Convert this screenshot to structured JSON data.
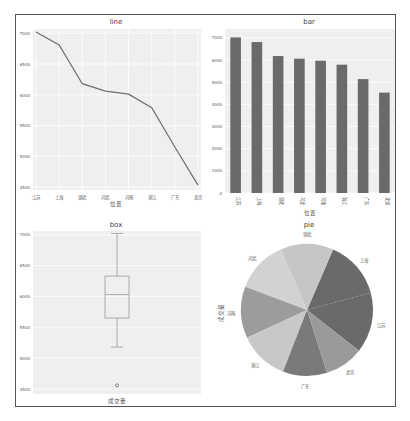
{
  "figure": {
    "panels": [
      "line",
      "bar",
      "box",
      "pie"
    ]
  },
  "colors": {
    "plot_bg": "#efefef",
    "grid": "#ffffff",
    "line": "#6e6e6e",
    "bar": "#6a6a6a",
    "box": "#9a9a9a",
    "text": "#555555",
    "frame": "#555555",
    "pie": [
      "#6a6a6a",
      "#6a6a6a",
      "#c6c6c6",
      "#d2d2d2",
      "#9c9c9c",
      "#c8c8c8",
      "#7a7a7a",
      "#9a9a9a"
    ]
  },
  "chart_data": [
    {
      "type": "line",
      "title": "line",
      "xlabel": "位置",
      "ylabel": "",
      "categories": [
        "江苏",
        "上海",
        "湖北",
        "河北",
        "河南",
        "浙江",
        "广东",
        "北京"
      ],
      "values": [
        7020,
        6810,
        6180,
        6060,
        6010,
        5790,
        5150,
        4530
      ],
      "yticks": [
        7000,
        6500,
        6000,
        5500,
        5000,
        4500
      ],
      "ylim": [
        4450,
        7070
      ],
      "grid": true
    },
    {
      "type": "bar",
      "title": "bar",
      "xlabel": "位置",
      "ylabel": "",
      "categories": [
        "江苏",
        "上海",
        "湖北",
        "河北",
        "河南",
        "浙江",
        "广东",
        "北京"
      ],
      "values": [
        7020,
        6810,
        6180,
        6060,
        5970,
        5790,
        5140,
        4530
      ],
      "yticks": [
        0,
        1000,
        2000,
        3000,
        4000,
        5000,
        6000,
        7000
      ],
      "ylim": [
        0,
        7400
      ],
      "grid": true,
      "xtick_rotation": 90
    },
    {
      "type": "box",
      "title": "box",
      "xlabel": "成交量",
      "ylabel": "",
      "stats": {
        "whisker_high": 7020,
        "q3": 6330,
        "median": 6030,
        "q1": 5650,
        "whisker_low": 5180,
        "outliers": [
          4560
        ]
      },
      "yticks": [
        7000,
        6500,
        6000,
        5500,
        5000,
        4500
      ],
      "ylim": [
        4420,
        7060
      ],
      "grid": true
    },
    {
      "type": "pie",
      "title": "pie",
      "ylabel": "成交量",
      "labels": [
        "江苏",
        "上海",
        "湖北",
        "河北",
        "河南",
        "浙江",
        "广东",
        "北京"
      ],
      "values": [
        7020,
        6810,
        6180,
        6060,
        6010,
        5790,
        5150,
        4530
      ]
    }
  ]
}
